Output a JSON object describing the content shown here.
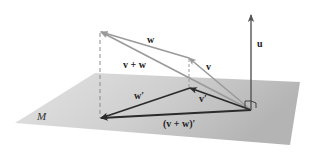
{
  "diagram": {
    "colors": {
      "plane": "#c9c9c9",
      "plane_edge": "#b5b5b5",
      "upper_vectors": "#9a9a9a",
      "projected_vectors": "#2b2b2b",
      "normal_vector": "#555555",
      "dashed": "#8a8a8a",
      "text": "#222222"
    },
    "labels": {
      "u": "u",
      "v": "v",
      "w": "w",
      "v_plus_w": "v + w",
      "v_prime": "v′",
      "w_prime": "w′",
      "v_plus_w_prime": "(v + w)′",
      "plane": "M"
    },
    "points": {
      "origin": [
        251,
        110
      ],
      "u_tip": [
        251,
        14
      ],
      "v_tip": [
        188,
        57
      ],
      "v_plus_w_tip": [
        100,
        31
      ],
      "v_prime_tip": [
        189,
        88
      ],
      "v_plus_w_prime_tip": [
        100,
        118
      ]
    }
  }
}
